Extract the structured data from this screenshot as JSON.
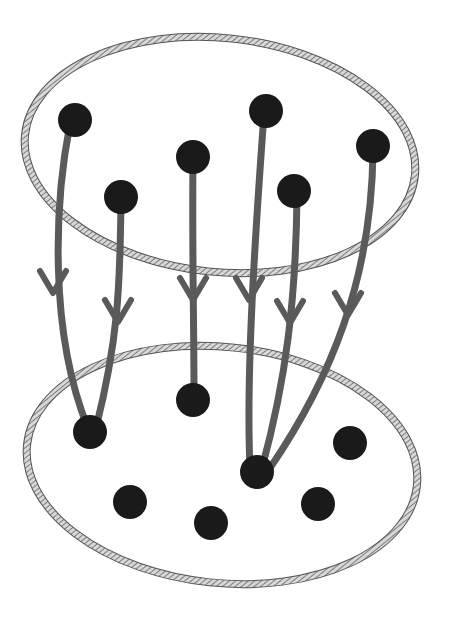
{
  "diagram": {
    "colors": {
      "background": "#ffffff",
      "set_outline": "#555555",
      "set_hatch": "#999999",
      "dot": "#1a1a1a",
      "arrow": "#5a5a5a"
    },
    "domain_set": {
      "label": "",
      "ellipse": {
        "cx": 220,
        "cy": 155,
        "rx": 196,
        "ry": 117,
        "rotate": 6
      },
      "points": [
        {
          "id": "a",
          "x": 75,
          "y": 120
        },
        {
          "id": "b",
          "x": 121,
          "y": 197
        },
        {
          "id": "c",
          "x": 193,
          "y": 157
        },
        {
          "id": "d",
          "x": 266,
          "y": 111
        },
        {
          "id": "e",
          "x": 294,
          "y": 191
        },
        {
          "id": "f",
          "x": 373,
          "y": 146
        }
      ]
    },
    "codomain_set": {
      "label": "",
      "ellipse": {
        "cx": 222,
        "cy": 465,
        "rx": 196,
        "ry": 118,
        "rotate": 6
      },
      "points": [
        {
          "id": "p",
          "x": 90,
          "y": 432
        },
        {
          "id": "q",
          "x": 193,
          "y": 400
        },
        {
          "id": "r",
          "x": 257,
          "y": 472
        },
        {
          "id": "s",
          "x": 350,
          "y": 443
        },
        {
          "id": "t",
          "x": 130,
          "y": 502
        },
        {
          "id": "u",
          "x": 211,
          "y": 523
        },
        {
          "id": "v",
          "x": 318,
          "y": 504
        }
      ]
    },
    "arrows": [
      {
        "from": "a",
        "to": "p",
        "path": "M70,124 C55,200 48,330 88,428",
        "head": {
          "x": 53,
          "y": 293
        }
      },
      {
        "from": "b",
        "to": "p",
        "path": "M121,200 C120,290 118,340 96,428",
        "head": {
          "x": 118,
          "y": 322
        }
      },
      {
        "from": "c",
        "to": "q",
        "path": "M193,160 C192,250 194,320 194,396",
        "head": {
          "x": 193,
          "y": 300
        }
      },
      {
        "from": "d",
        "to": "r",
        "path": "M264,114 C254,250 246,380 250,468",
        "head": {
          "x": 249,
          "y": 300
        }
      },
      {
        "from": "e",
        "to": "r",
        "path": "M297,195 C296,300 286,380 262,468",
        "head": {
          "x": 290,
          "y": 323
        }
      },
      {
        "from": "f",
        "to": "r",
        "path": "M373,150 C372,280 330,380 270,468",
        "head": {
          "x": 348,
          "y": 315
        }
      }
    ]
  }
}
